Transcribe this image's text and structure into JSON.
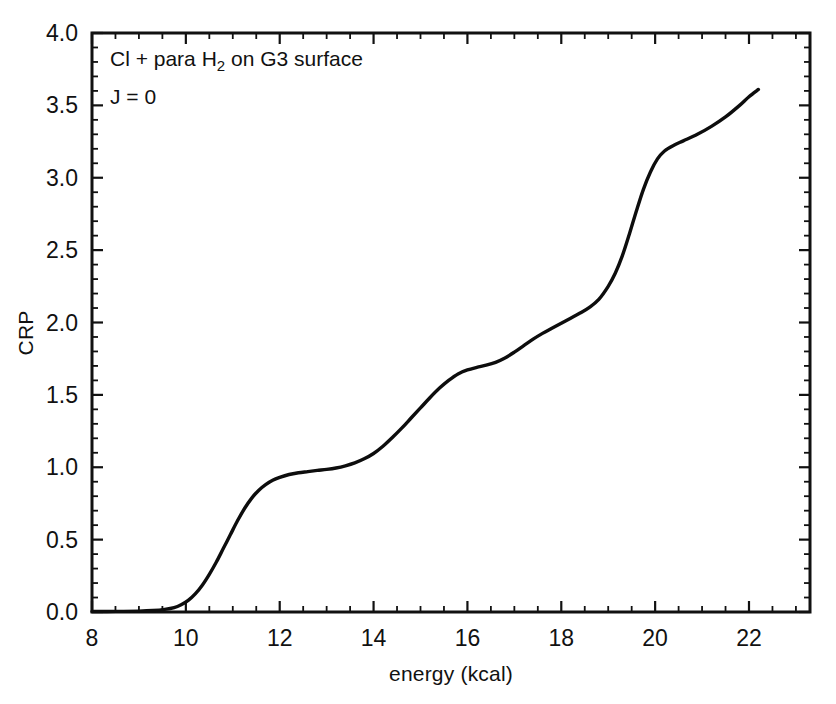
{
  "chart_data": {
    "type": "line",
    "title": "",
    "xlabel": "energy (kcal)",
    "ylabel": "CRP",
    "xlim": [
      8,
      23.3
    ],
    "ylim": [
      0.0,
      4.0
    ],
    "grid": false,
    "legend": "none",
    "annotations": [
      {
        "text_parts": {
          "pre": "Cl + para H",
          "sub": "2",
          "post": " on G3 surface"
        },
        "x": 8.35,
        "y": 3.82
      },
      {
        "text": "J = 0",
        "x": 8.35,
        "y": 3.52
      }
    ],
    "xticks": [
      8,
      10,
      12,
      14,
      16,
      18,
      20,
      22
    ],
    "xtick_labels": [
      "8",
      "10",
      "12",
      "14",
      "16",
      "18",
      "20",
      "22"
    ],
    "xtick_minor_step": 0.5,
    "yticks": [
      0.0,
      0.5,
      1.0,
      1.5,
      2.0,
      2.5,
      3.0,
      3.5,
      4.0
    ],
    "ytick_labels": [
      "0.0",
      "0.5",
      "1.0",
      "1.5",
      "2.0",
      "2.5",
      "3.0",
      "3.5",
      "4.0"
    ],
    "ytick_minor_step": 0.1,
    "series": [
      {
        "name": "CRP",
        "color": "#0d0d0d",
        "x": [
          8.0,
          8.5,
          9.0,
          9.3,
          9.55,
          9.75,
          9.9,
          10.05,
          10.2,
          10.35,
          10.5,
          10.65,
          10.8,
          10.95,
          11.1,
          11.25,
          11.4,
          11.55,
          11.7,
          11.85,
          12.0,
          12.2,
          12.4,
          12.6,
          12.8,
          13.0,
          13.2,
          13.4,
          13.6,
          13.8,
          14.0,
          14.2,
          14.4,
          14.6,
          14.8,
          15.0,
          15.2,
          15.4,
          15.6,
          15.8,
          16.0,
          16.2,
          16.4,
          16.6,
          16.8,
          17.0,
          17.2,
          17.4,
          17.6,
          17.8,
          18.0,
          18.2,
          18.4,
          18.6,
          18.8,
          19.0,
          19.15,
          19.3,
          19.45,
          19.6,
          19.75,
          19.9,
          20.05,
          20.2,
          20.4,
          20.6,
          20.9,
          21.2,
          21.5,
          21.8,
          22.0,
          22.2
        ],
        "y": [
          0.003,
          0.004,
          0.006,
          0.01,
          0.018,
          0.03,
          0.05,
          0.08,
          0.125,
          0.185,
          0.26,
          0.345,
          0.44,
          0.535,
          0.63,
          0.715,
          0.785,
          0.84,
          0.88,
          0.91,
          0.93,
          0.95,
          0.962,
          0.97,
          0.978,
          0.985,
          0.995,
          1.01,
          1.03,
          1.058,
          1.095,
          1.145,
          1.205,
          1.27,
          1.34,
          1.41,
          1.48,
          1.545,
          1.6,
          1.645,
          1.672,
          1.69,
          1.705,
          1.725,
          1.755,
          1.795,
          1.84,
          1.885,
          1.925,
          1.96,
          1.995,
          2.03,
          2.065,
          2.105,
          2.16,
          2.25,
          2.34,
          2.46,
          2.61,
          2.77,
          2.92,
          3.04,
          3.13,
          3.185,
          3.225,
          3.255,
          3.3,
          3.355,
          3.42,
          3.5,
          3.56,
          3.61
        ]
      }
    ]
  },
  "figure": {
    "background_color": "#ffffff",
    "line_color": "#0d0d0d",
    "axis_color": "#111111"
  }
}
